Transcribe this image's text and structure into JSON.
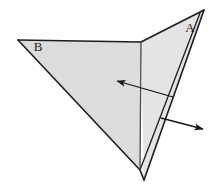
{
  "figure": {
    "background_color": "#ffffff",
    "canvas": {
      "width": 220,
      "height": 190
    }
  },
  "style": {
    "panel_fill_left": "#dcdcdc",
    "panel_fill_right": "#e4e4e4",
    "panel_fill_underside": "#f0f0f0",
    "outline_color": "#1c1c1c",
    "crease_color": "#4a4a4a",
    "arrow_color": "#151515",
    "outline_width": 1.6,
    "crease_width": 1.3,
    "arrow_width": 1.3
  },
  "geometry": {
    "vertex_left": {
      "x": 18,
      "y": 40
    },
    "vertex_crease_top": {
      "x": 141,
      "y": 42
    },
    "vertex_apex_right": {
      "x": 204,
      "y": 10
    },
    "vertex_bottom_front": {
      "x": 140,
      "y": 170
    },
    "vertex_bottom_back": {
      "x": 144,
      "y": 180
    },
    "panel_left_points": "18,40 141,42 140,170",
    "panel_right_points": "141,42 204,10 144,180",
    "panel_underside_points": "140,170 144,180 160,122",
    "crease_vertical": {
      "x1": 141,
      "y1": 42,
      "x2": 140,
      "y2": 170
    },
    "fold_edge_outer": {
      "x1": 204,
      "y1": 10,
      "x2": 144,
      "y2": 180
    },
    "fold_edge_inner": {
      "x1": 200,
      "y1": 13,
      "x2": 140,
      "y2": 170
    },
    "edge_left_lower": {
      "x1": 18,
      "y1": 40,
      "x2": 140,
      "y2": 170
    },
    "edge_top": {
      "x1": 18,
      "y1": 40,
      "x2": 141,
      "y2": 42
    }
  },
  "labels": [
    {
      "name": "panel-label-a",
      "text": "A",
      "x": 190,
      "y": 32,
      "anchor": "middle"
    },
    {
      "name": "panel-label-b",
      "text": "B",
      "x": 38,
      "y": 51,
      "anchor": "middle"
    }
  ],
  "arrows": [
    {
      "name": "arrow-left",
      "label": "leftward motion arrow",
      "tail": {
        "x": 173,
        "y": 97
      },
      "head": {
        "x": 117,
        "y": 81
      },
      "head_size": 7
    },
    {
      "name": "arrow-right",
      "label": "rightward motion arrow",
      "tail": {
        "x": 161,
        "y": 118
      },
      "head": {
        "x": 203,
        "y": 129
      },
      "head_size": 7
    }
  ]
}
